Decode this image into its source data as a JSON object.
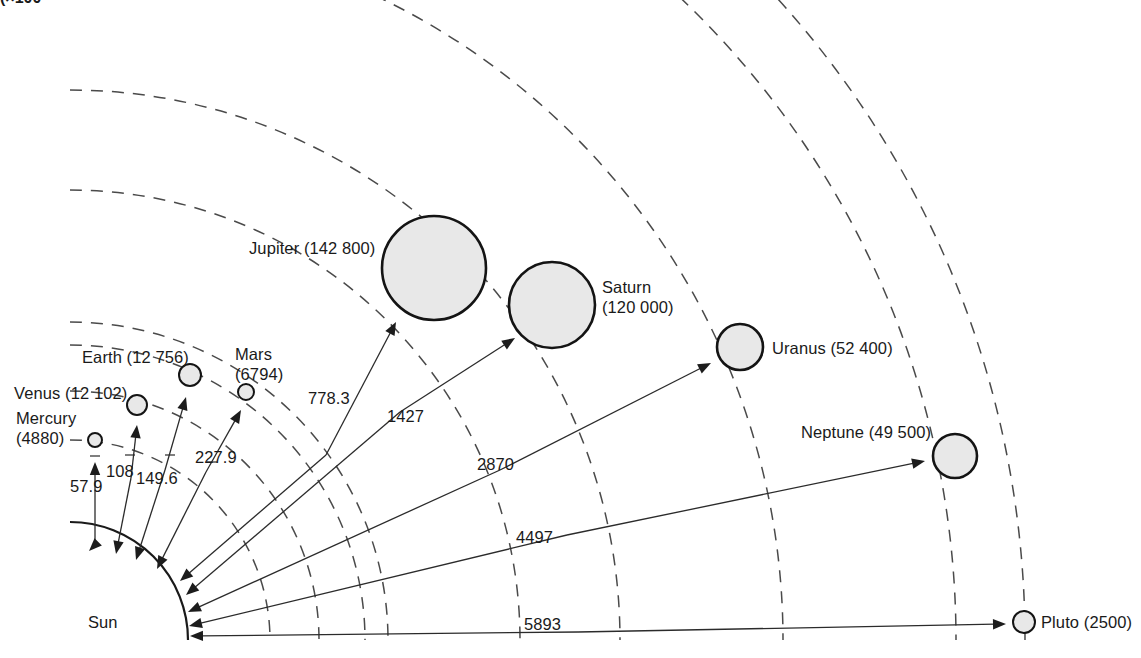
{
  "figure": {
    "clipped_top_left_text": "(×100",
    "clipped_top_right_text": "·",
    "sun_label": "Sun",
    "units_note_diameters": "km",
    "units_note_distances": "million km"
  },
  "canvas": {
    "width": 1141,
    "height": 658,
    "background": "#ffffff",
    "ink": "#1a1a1a",
    "planet_fill": "#e8e8e8",
    "orbit_stroke": "#4a4a4a"
  },
  "sun": {
    "name": "Sun",
    "center_x": 70,
    "center_y": 640,
    "radius": 118,
    "label_x": 88,
    "label_y": 628
  },
  "chart_data": {
    "type": "scatter",
    "xlabel": "Mean distance from Sun (million km)",
    "ylabel": "Planet diameter (km)",
    "categories": [
      "Mercury",
      "Venus",
      "Earth",
      "Mars",
      "Jupiter",
      "Saturn",
      "Uranus",
      "Neptune",
      "Pluto"
    ],
    "series": [
      {
        "name": "Distance from Sun (million km)",
        "values": [
          57.9,
          108,
          149.6,
          227.9,
          778.3,
          1427,
          2870,
          4497,
          5893
        ]
      },
      {
        "name": "Diameter (km)",
        "values": [
          4880,
          12102,
          12756,
          6794,
          142800,
          120000,
          52400,
          49500,
          2500
        ]
      }
    ],
    "legend": "none",
    "grid": false
  },
  "planets": [
    {
      "id": "mercury",
      "name": "Mercury",
      "diameter_label": "(4880)",
      "distance_label": "57.9",
      "label_lines": [
        "Mercury",
        "(4880)"
      ],
      "label_x": 16,
      "label_y": 424,
      "label_anchor": "start",
      "cx": 95,
      "cy": 440,
      "r": 7,
      "orbit_r": 200,
      "arrow_from_x": 95,
      "arrow_from_y": 545,
      "arrow_to_x": 95,
      "arrow_to_y": 462,
      "arrow_to_sun_x": 89,
      "arrow_to_sun_y": 551,
      "dist_label_x": 70,
      "dist_label_y": 492,
      "tick_x": 95,
      "tick_y": 456
    },
    {
      "id": "venus",
      "name": "Venus",
      "diameter_label": "(12 102)",
      "distance_label": "108",
      "label_lines": [
        "Venus (12 102)"
      ],
      "label_x": 14,
      "label_y": 399,
      "label_anchor": "start",
      "cx": 137,
      "cy": 405,
      "r": 10,
      "orbit_r": 249,
      "arrow_from_x": 131,
      "arrow_from_y": 478,
      "arrow_to_x": 137,
      "arrow_to_y": 425,
      "arrow_to_sun_x": 116,
      "arrow_to_sun_y": 554,
      "dist_label_x": 106,
      "dist_label_y": 477,
      "tick_x": 130,
      "tick_y": 455
    },
    {
      "id": "earth",
      "name": "Earth",
      "diameter_label": "(12 756)",
      "distance_label": "149.6",
      "label_lines": [
        "Earth (12 756)"
      ],
      "label_x": 82,
      "label_y": 363,
      "label_anchor": "start",
      "cx": 190,
      "cy": 375,
      "r": 11,
      "orbit_r": 295,
      "arrow_from_x": 165,
      "arrow_from_y": 470,
      "arrow_to_x": 186,
      "arrow_to_y": 397,
      "arrow_to_sun_x": 136,
      "arrow_to_sun_y": 560,
      "dist_label_x": 136,
      "dist_label_y": 484,
      "tick_x": 170,
      "tick_y": 455
    },
    {
      "id": "mars",
      "name": "Mars",
      "diameter_label": "(6794)",
      "distance_label": "227.9",
      "label_lines": [
        "Mars",
        "(6794)"
      ],
      "label_x": 235,
      "label_y": 360,
      "label_anchor": "start",
      "cx": 246,
      "cy": 392,
      "r": 8,
      "orbit_r": 318,
      "arrow_from_x": 206,
      "arrow_from_y": 472,
      "arrow_to_x": 241,
      "arrow_to_y": 410,
      "arrow_to_sun_x": 157,
      "arrow_to_sun_y": 569,
      "dist_label_x": 195,
      "dist_label_y": 463,
      "tick_x": 212,
      "tick_y": 462
    },
    {
      "id": "jupiter",
      "name": "Jupiter",
      "diameter_label": "(142 800)",
      "distance_label": "778.3",
      "label_lines": [
        "Jupiter (142 800)"
      ],
      "label_x": 249,
      "label_y": 254,
      "label_anchor": "start",
      "cx": 434,
      "cy": 268,
      "r": 52,
      "orbit_r": 450,
      "arrow_from_x": 326,
      "arrow_from_y": 455,
      "arrow_to_x": 396,
      "arrow_to_y": 322,
      "arrow_to_sun_x": 180,
      "arrow_to_sun_y": 581,
      "dist_label_x": 308,
      "dist_label_y": 404,
      "tick_x": 0,
      "tick_y": 0
    },
    {
      "id": "saturn",
      "name": "Saturn",
      "diameter_label": "(120 000)",
      "distance_label": "1427",
      "label_lines": [
        "Saturn",
        "(120 000)"
      ],
      "label_x": 602,
      "label_y": 293,
      "label_anchor": "start",
      "cx": 552,
      "cy": 305,
      "r": 43,
      "orbit_r": 550,
      "arrow_from_x": 400,
      "arrow_from_y": 412,
      "arrow_to_x": 515,
      "arrow_to_y": 338,
      "arrow_to_sun_x": 186,
      "arrow_to_sun_y": 595,
      "dist_label_x": 387,
      "dist_label_y": 422,
      "tick_x": 0,
      "tick_y": 0
    },
    {
      "id": "uranus",
      "name": "Uranus",
      "diameter_label": "(52 400)",
      "distance_label": "2870",
      "label_lines": [
        "Uranus (52 400)"
      ],
      "label_x": 772,
      "label_y": 354,
      "label_anchor": "start",
      "cx": 740,
      "cy": 347,
      "r": 23,
      "orbit_r": 713,
      "arrow_from_x": 500,
      "arrow_from_y": 470,
      "arrow_to_x": 711,
      "arrow_to_y": 363,
      "arrow_to_sun_x": 188,
      "arrow_to_sun_y": 612,
      "dist_label_x": 477,
      "dist_label_y": 470,
      "tick_x": 0,
      "tick_y": 0
    },
    {
      "id": "neptune",
      "name": "Neptune",
      "diameter_label": "(49 500)",
      "distance_label": "4497",
      "label_lines": [
        "Neptune (49 500)"
      ],
      "label_x": 801,
      "label_y": 438,
      "label_anchor": "start",
      "cx": 955,
      "cy": 456,
      "r": 22,
      "orbit_r": 886,
      "arrow_from_x": 567,
      "arrow_from_y": 535,
      "arrow_to_x": 925,
      "arrow_to_y": 461,
      "arrow_to_sun_x": 189,
      "arrow_to_sun_y": 626,
      "dist_label_x": 516,
      "dist_label_y": 543,
      "tick_x": 0,
      "tick_y": 0
    },
    {
      "id": "pluto",
      "name": "Pluto",
      "diameter_label": "(2500)",
      "distance_label": "5893",
      "label_lines": [
        "Pluto (2500)"
      ],
      "label_x": 1041,
      "label_y": 628,
      "label_anchor": "start",
      "cx": 1024,
      "cy": 622,
      "r": 11,
      "orbit_r": 955,
      "arrow_from_x": 578,
      "arrow_from_y": 632,
      "arrow_to_x": 1006,
      "arrow_to_y": 624,
      "arrow_to_sun_x": 190,
      "arrow_to_sun_y": 636,
      "dist_label_x": 524,
      "dist_label_y": 630,
      "tick_x": 0,
      "tick_y": 0
    }
  ],
  "orbit_arcs": [
    {
      "id": "orbit-mercury",
      "r": 200
    },
    {
      "id": "orbit-venus",
      "r": 249
    },
    {
      "id": "orbit-earth",
      "r": 295
    },
    {
      "id": "orbit-mars",
      "r": 318
    },
    {
      "id": "orbit-jupiter",
      "r": 450
    },
    {
      "id": "orbit-saturn",
      "r": 550
    },
    {
      "id": "orbit-uranus",
      "r": 713
    },
    {
      "id": "orbit-neptune",
      "r": 886
    },
    {
      "id": "orbit-pluto",
      "r": 955
    }
  ]
}
